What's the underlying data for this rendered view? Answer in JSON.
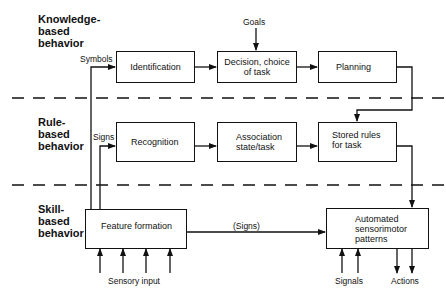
{
  "levels": {
    "knowledge": [
      "Knowledge-",
      "based",
      "behavior"
    ],
    "rule": [
      "Rule-",
      "based",
      "behavior"
    ],
    "skill": [
      "Skill-",
      "based",
      "behavior"
    ]
  },
  "boxes": {
    "identification": "Identification",
    "decision_line1": "Decision, choice",
    "decision_line2": "of task",
    "planning": "Planning",
    "recognition": "Recognition",
    "association_line1": "Association",
    "association_line2": "state/task",
    "stored_line1": "Stored rules",
    "stored_line2": "for task",
    "feature": "Feature formation",
    "automated_line1": "Automated",
    "automated_line2": "sensorimotor",
    "automated_line3": "patterns"
  },
  "labels": {
    "goals": "Goals",
    "symbols": "Symbols",
    "signs": "Signs",
    "signs_paren": "(Signs)",
    "sensory_input": "Sensory input",
    "signals": "Signals",
    "actions": "Actions"
  },
  "colors": {
    "ink": "#111111",
    "background": "#ffffff"
  }
}
